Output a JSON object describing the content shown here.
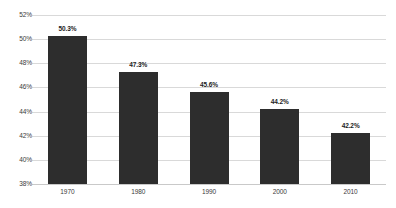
{
  "chart_data": {
    "type": "bar",
    "title": "",
    "subtitle": "",
    "xlabel": "",
    "ylabel": "",
    "categories": [
      "1970",
      "1980",
      "1990",
      "2000",
      "2010"
    ],
    "values": [
      50.3,
      47.3,
      45.6,
      44.2,
      42.2
    ],
    "value_labels": [
      "50.3%",
      "47.3%",
      "45.6%",
      "44.2%",
      "42.2%"
    ],
    "ylim": [
      38,
      52
    ],
    "ytick_values": [
      38,
      40,
      42,
      44,
      46,
      48,
      50,
      52
    ],
    "ytick_labels": [
      "38%",
      "40%",
      "42%",
      "44%",
      "46%",
      "48%",
      "50%",
      "52%"
    ],
    "grid": true,
    "grid_axis": "y",
    "legend": false,
    "legend_position": "none",
    "series": [
      {
        "name": "",
        "values": [
          50.3,
          47.3,
          45.6,
          44.2,
          42.2
        ]
      }
    ],
    "colors": {
      "bar": "#2d2d2d",
      "gridline": "#d9d9d9",
      "baseline": "#c9c9c9",
      "tick_text": "#3a3a3a",
      "value_text": "#1c1c1c",
      "background": "#ffffff"
    }
  }
}
